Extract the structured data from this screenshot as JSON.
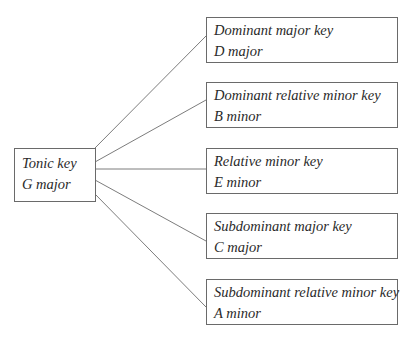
{
  "diagram": {
    "source": {
      "title": "Tonic key",
      "value": "G major"
    },
    "targets": [
      {
        "title": "Dominant major key",
        "value": "D major"
      },
      {
        "title": "Dominant relative minor key",
        "value": "B minor"
      },
      {
        "title": "Relative minor key",
        "value": "E minor"
      },
      {
        "title": "Subdominant major key",
        "value": "C major"
      },
      {
        "title": "Subdominant relative minor key",
        "value": "A minor"
      }
    ],
    "colors": {
      "line": "#5a5a5a",
      "border": "#6a6a6a",
      "text": "#2a2a2a"
    }
  }
}
